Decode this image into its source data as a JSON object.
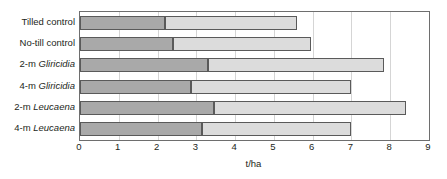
{
  "chart_data": {
    "type": "bar",
    "orientation": "horizontal",
    "stacked": true,
    "title": "",
    "xlabel": "t/ha",
    "ylabel": "",
    "xlim": [
      0,
      9
    ],
    "xticks": [
      0,
      1,
      2,
      3,
      4,
      5,
      6,
      7,
      8,
      9
    ],
    "xtick_labels": [
      "0",
      "1",
      "2",
      "3",
      "4",
      "5",
      "6",
      "7",
      "8",
      "9"
    ],
    "grid": true,
    "legend": "none",
    "categories": [
      "Tilled control",
      "No-till control",
      "2-m Gliricidia",
      "4-m Gliricidia",
      "2-m Leucaena",
      "4-m Leucaena"
    ],
    "category_parts": [
      {
        "plain": "Tilled control",
        "sci": ""
      },
      {
        "plain": "No-till control",
        "sci": ""
      },
      {
        "plain": "2-m ",
        "sci": "Gliricidia"
      },
      {
        "plain": "4-m ",
        "sci": "Gliricidia"
      },
      {
        "plain": "2-m ",
        "sci": "Leucaena"
      },
      {
        "plain": "4-m ",
        "sci": "Leucaena"
      }
    ],
    "series": [
      {
        "name": "first segment",
        "color": "#a9a9a9",
        "values": [
          2.2,
          2.4,
          3.3,
          2.85,
          3.45,
          3.15
        ]
      },
      {
        "name": "second segment",
        "color": "#dcdcdc",
        "values": [
          3.4,
          3.55,
          4.53,
          4.15,
          4.95,
          3.85
        ]
      }
    ],
    "totals": [
      5.6,
      5.95,
      7.83,
      7.0,
      8.4,
      7.0
    ]
  },
  "style": {
    "dark_segment_color": "#a9a9a9",
    "light_segment_color": "#dcdcdc",
    "segment_border_color": "#5a5a5a",
    "frame_color": "#6e6e6e",
    "gridline_color": "#d5d5d5",
    "text_color": "#231f20",
    "background_color": "#ffffff"
  }
}
